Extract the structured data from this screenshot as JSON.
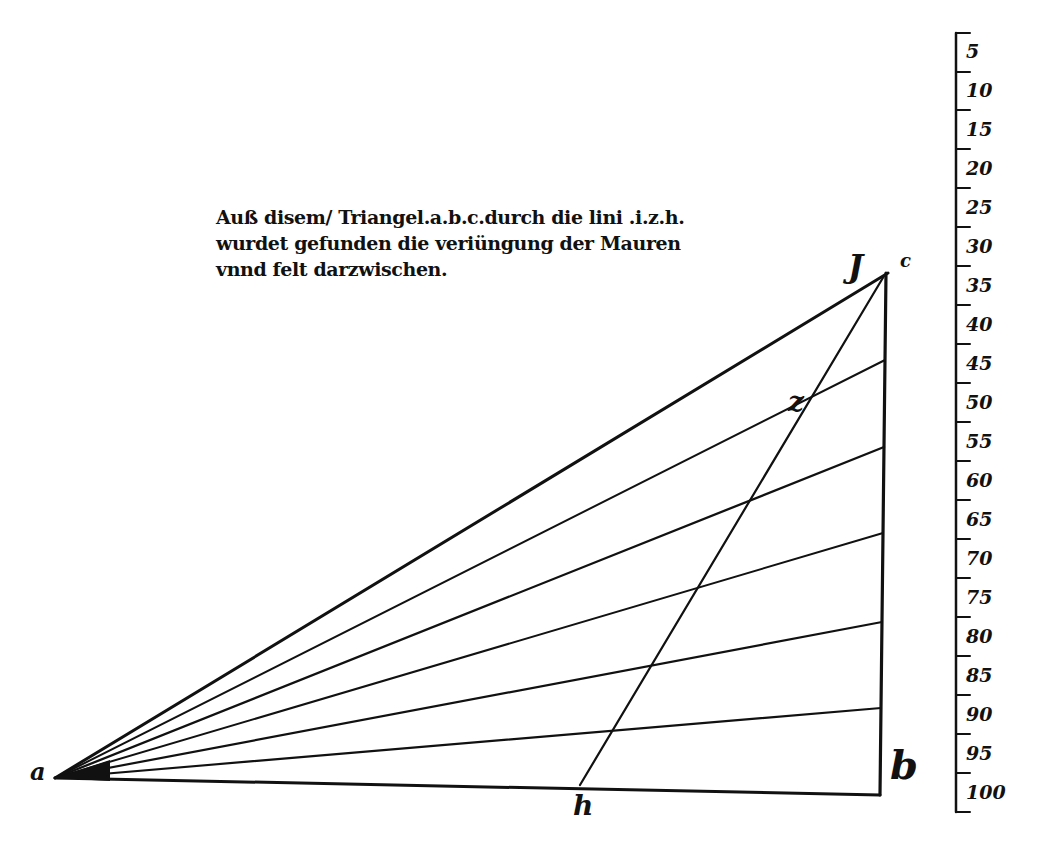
{
  "caption": {
    "lines": [
      "Auß disem/ Triangel.a.b.c.durch die lini .i.z.h.",
      "wurdet gefunden die veriüngung der Mauren",
      "vnnd felt darzwischen."
    ]
  },
  "labels": {
    "a": "a",
    "b": "b",
    "c": "c",
    "i": "J",
    "z": "z",
    "h": "h"
  },
  "scale": {
    "ticks": [
      "5",
      "10",
      "15",
      "20",
      "25",
      "30",
      "35",
      "40",
      "45",
      "50",
      "55",
      "60",
      "65",
      "70",
      "75",
      "80",
      "85",
      "90",
      "95",
      "100"
    ]
  },
  "colors": {
    "ink": "#111111",
    "paper": "#ffffff"
  }
}
